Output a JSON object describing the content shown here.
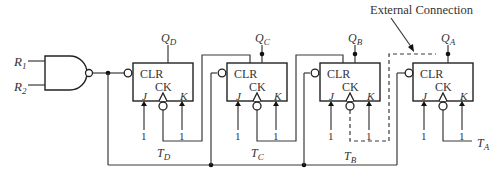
{
  "diagram": {
    "inputs": {
      "r1": "R",
      "r1_sub": "1",
      "r2": "R",
      "r2_sub": "2"
    },
    "annotation": "External Connection",
    "flipflops": [
      {
        "id": "D",
        "q_label": "Q",
        "q_sub": "D",
        "t_label": "T",
        "t_sub": "D",
        "clr": "CLR",
        "ck": "CK",
        "j": "J",
        "k": "K",
        "j_val": "1",
        "k_val": "1"
      },
      {
        "id": "C",
        "q_label": "Q",
        "q_sub": "C",
        "t_label": "T",
        "t_sub": "C",
        "clr": "CLR",
        "ck": "CK",
        "j": "J",
        "k": "K",
        "j_val": "1",
        "k_val": "1"
      },
      {
        "id": "B",
        "q_label": "Q",
        "q_sub": "B",
        "t_label": "T",
        "t_sub": "B",
        "clr": "CLR",
        "ck": "CK",
        "j": "J",
        "k": "K",
        "j_val": "1",
        "k_val": "1"
      },
      {
        "id": "A",
        "q_label": "Q",
        "q_sub": "A",
        "t_label": "T",
        "t_sub": "A",
        "clr": "CLR",
        "ck": "CK",
        "j": "J",
        "k": "K",
        "j_val": "1",
        "k_val": "1"
      }
    ]
  }
}
